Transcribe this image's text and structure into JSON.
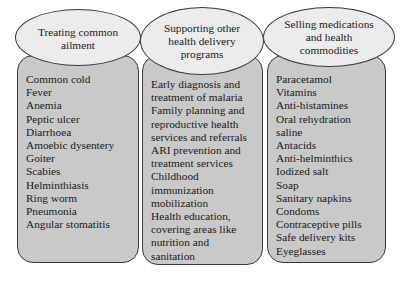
{
  "diagram": {
    "columns": [
      {
        "header": "Treating common ailment",
        "items": [
          "Common cold",
          "Fever",
          "Anemia",
          "Peptic ulcer",
          "Diarrhoea",
          "Amoebic dysentery",
          "Goiter",
          "Scabies",
          "Helminthiasis",
          "Ring worm",
          "Pneumonia",
          "Angular stomatitis"
        ]
      },
      {
        "header": "Supporting other health delivery programs",
        "items": [
          "Early diagnosis and",
          "treatment of malaria",
          "Family planning and",
          "reproductive health",
          "services and referrals",
          "ARI prevention and",
          "treatment services",
          "Childhood",
          "immunization",
          "mobilization",
          "Health education,",
          "covering areas like",
          "nutrition and",
          "sanitation"
        ]
      },
      {
        "header": "Selling medications and health commodities",
        "items": [
          "Paracetamol",
          "Vitamins",
          "Anti-histamines",
          "Oral rehydration",
          "saline",
          "Antacids",
          "Anti-helminthics",
          "Iodized salt",
          "Soap",
          "Sanitary napkins",
          "Condoms",
          "Contraceptive pills",
          "Safe delivery kits",
          "Eyeglasses"
        ]
      }
    ],
    "colors": {
      "box_fill": "#c9c9c9",
      "ellipse_fill": "#ececec",
      "stroke": "#3a3a3a",
      "text": "#1a1a1a"
    }
  }
}
